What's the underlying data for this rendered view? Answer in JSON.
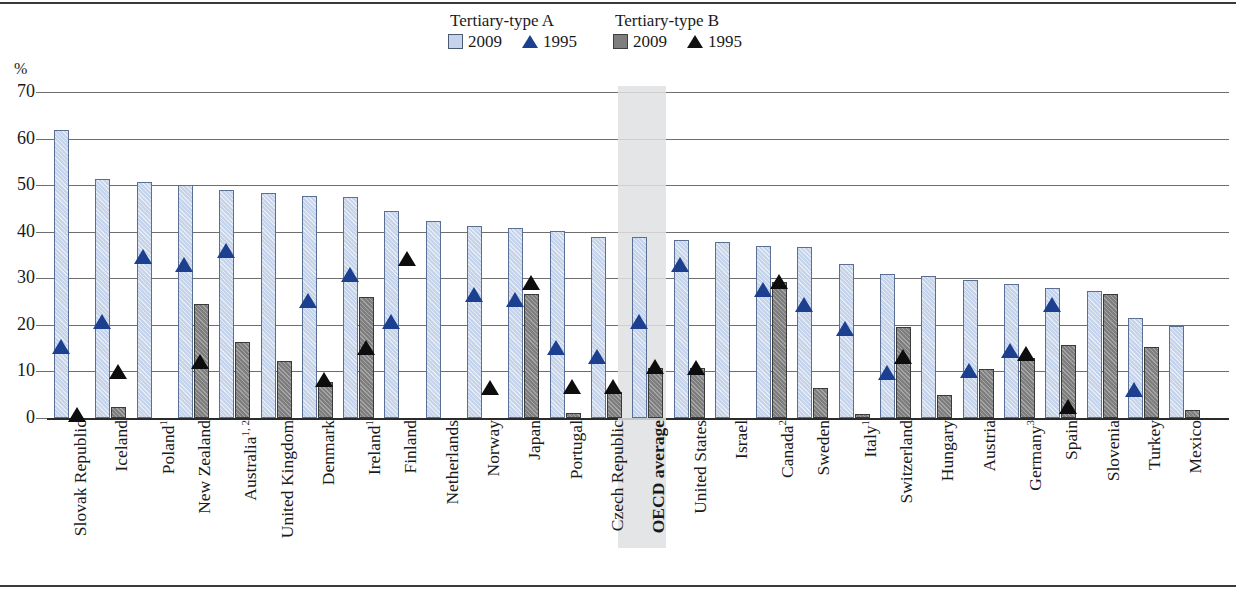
{
  "legend": {
    "groups": [
      {
        "title": "Tertiary-type A",
        "items": [
          {
            "label": "2009",
            "marker": "square-light-blue"
          },
          {
            "label": "1995",
            "marker": "triangle-blue"
          }
        ]
      },
      {
        "title": "Tertiary-type B",
        "items": [
          {
            "label": "2009",
            "marker": "square-gray"
          },
          {
            "label": "1995",
            "marker": "triangle-black"
          }
        ]
      }
    ]
  },
  "axis": {
    "unit": "%",
    "ticks": [
      "70",
      "60",
      "50",
      "40",
      "30",
      "20",
      "10",
      "0"
    ]
  },
  "colors": {
    "bar_a_2009": "#c5d4ea",
    "bar_b_2009": "#7e7e7e",
    "marker_a_1995": "#1c3f8f",
    "marker_b_1995": "#0d0d0d",
    "highlight_band": "#dfe0e2",
    "gridline": "#6e6e6e"
  },
  "highlight": {
    "category": "OECD average"
  },
  "chart_data": {
    "type": "bar",
    "title": "",
    "subtitle": "",
    "xlabel": "",
    "ylabel": "%",
    "ylim": [
      0,
      70
    ],
    "ytick_step": 10,
    "grid": true,
    "legend_position": "top-center",
    "categories": [
      "Slovak Republic",
      "Iceland",
      "Poland¹",
      "New Zealand",
      "Australia¹,²",
      "United Kingdom",
      "Denmark",
      "Ireland¹",
      "Finland",
      "Netherlands",
      "Norway",
      "Japan",
      "Portugal",
      "Czech Republic",
      "OECD average",
      "United States",
      "Israel",
      "Canada²",
      "Sweden",
      "Italy¹",
      "Switzerland",
      "Hungary",
      "Austria",
      "Germany³",
      "Spain",
      "Slovenia",
      "Turkey",
      "Mexico"
    ],
    "category_labels": [
      {
        "name": "Slovak Republic",
        "footnote": ""
      },
      {
        "name": "Iceland",
        "footnote": ""
      },
      {
        "name": "Poland",
        "footnote": "1"
      },
      {
        "name": "New Zealand",
        "footnote": ""
      },
      {
        "name": "Australia",
        "footnote": "1, 2"
      },
      {
        "name": "United Kingdom",
        "footnote": ""
      },
      {
        "name": "Denmark",
        "footnote": ""
      },
      {
        "name": "Ireland",
        "footnote": "1"
      },
      {
        "name": "Finland",
        "footnote": ""
      },
      {
        "name": "Netherlands",
        "footnote": ""
      },
      {
        "name": "Norway",
        "footnote": ""
      },
      {
        "name": "Japan",
        "footnote": ""
      },
      {
        "name": "Portugal",
        "footnote": ""
      },
      {
        "name": "Czech Republic",
        "footnote": ""
      },
      {
        "name": "OECD average",
        "footnote": ""
      },
      {
        "name": "United States",
        "footnote": ""
      },
      {
        "name": "Israel",
        "footnote": ""
      },
      {
        "name": "Canada",
        "footnote": "2"
      },
      {
        "name": "Sweden",
        "footnote": ""
      },
      {
        "name": "Italy",
        "footnote": "1"
      },
      {
        "name": "Switzerland",
        "footnote": ""
      },
      {
        "name": "Hungary",
        "footnote": ""
      },
      {
        "name": "Austria",
        "footnote": ""
      },
      {
        "name": "Germany",
        "footnote": "3"
      },
      {
        "name": "Spain",
        "footnote": ""
      },
      {
        "name": "Slovenia",
        "footnote": ""
      },
      {
        "name": "Turkey",
        "footnote": ""
      },
      {
        "name": "Mexico",
        "footnote": ""
      }
    ],
    "series": [
      {
        "name": "Tertiary-type A 2009",
        "kind": "bar",
        "values": [
          61.5,
          51.0,
          50.2,
          49.5,
          48.6,
          47.8,
          47.3,
          47.0,
          44.0,
          41.8,
          40.9,
          40.4,
          39.8,
          38.4,
          38.4,
          37.9,
          37.4,
          36.6,
          36.2,
          32.7,
          30.5,
          30.0,
          29.3,
          28.4,
          27.4,
          26.8,
          21.0,
          19.4
        ]
      },
      {
        "name": "Tertiary-type B 2009",
        "kind": "bar",
        "values": [
          0.0,
          1.9,
          0.0,
          24.0,
          15.8,
          11.8,
          7.3,
          25.5,
          0.0,
          0.0,
          0.0,
          26.2,
          0.6,
          5.1,
          10.3,
          10.4,
          0.0,
          28.7,
          6.1,
          0.5,
          19.1,
          4.6,
          10.0,
          12.4,
          15.3,
          26.2,
          14.9,
          1.3
        ]
      },
      {
        "name": "Tertiary-type A 1995",
        "kind": "marker",
        "values": [
          14.8,
          20.1,
          34.1,
          32.5,
          35.5,
          null,
          24.6,
          30.2,
          20.1,
          null,
          26.0,
          25.0,
          14.6,
          12.6,
          20.1,
          32.5,
          null,
          27.0,
          23.8,
          18.6,
          9.3,
          null,
          9.6,
          14.0,
          23.8,
          null,
          5.6,
          null
        ]
      },
      {
        "name": "Tertiary-type B 1995",
        "kind": "marker",
        "values": [
          0.3,
          9.5,
          null,
          11.6,
          null,
          null,
          7.7,
          14.7,
          33.8,
          null,
          6.0,
          28.6,
          6.2,
          6.2,
          10.6,
          10.4,
          null,
          28.7,
          null,
          null,
          12.7,
          null,
          null,
          13.3,
          1.9,
          null,
          null,
          null
        ]
      }
    ]
  }
}
